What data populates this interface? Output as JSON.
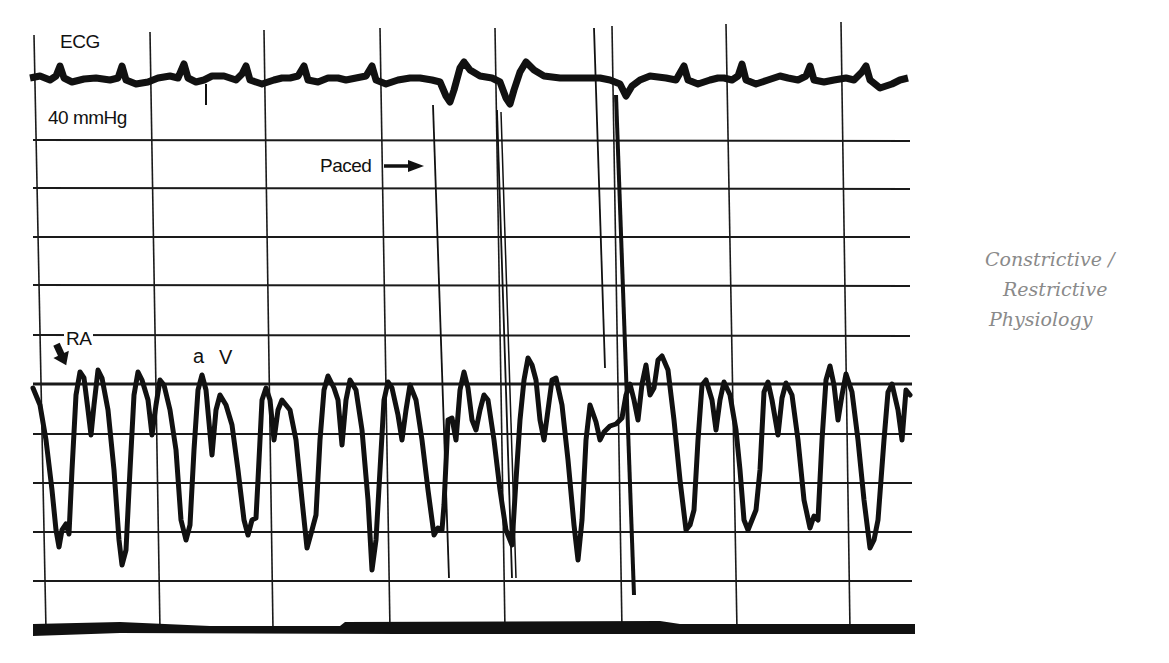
{
  "figure": {
    "type": "hemodynamic strip chart recording",
    "labels": {
      "ecg": "ECG",
      "scale": "40 mmHg",
      "paced": "Paced",
      "ra": "RA",
      "a_wave": "a",
      "v_wave": "V"
    },
    "annotation": {
      "lines": [
        "Constrictive /",
        "Restrictive",
        "Physiology"
      ],
      "color": "#8a8a8a"
    },
    "icons": {
      "paced_arrow": "right-arrow-icon",
      "ra_arrow": "down-arrow-icon"
    },
    "colors": {
      "trace": "#111111",
      "grid": "#1a1a1a",
      "background": "#ffffff"
    },
    "grid": {
      "horizontal_lines_y": [
        140,
        188,
        237,
        285,
        335,
        384,
        434,
        483,
        532,
        581
      ],
      "baseline_y": 630,
      "major_vertical_lines_x": [
        37,
        153,
        268,
        385,
        500,
        614,
        730,
        845
      ],
      "pacing_spikes_x": [
        438,
        497,
        512,
        594,
        620
      ]
    },
    "traces": [
      {
        "name": "ECG",
        "position": "top",
        "baseline_y": 80
      },
      {
        "name": "RA pressure",
        "position": "bottom",
        "range_y": [
          355,
          570
        ]
      }
    ]
  }
}
